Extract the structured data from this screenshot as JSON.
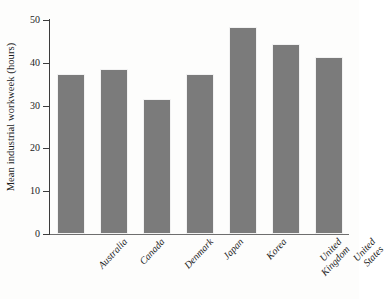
{
  "chart_data": {
    "type": "bar",
    "title": "",
    "subtitle": "",
    "xlabel": "",
    "ylabel": "Mean industrial workweek (hours)",
    "categories": [
      "Australia",
      "Canada",
      "Denmark",
      "Japan",
      "Korea",
      "United Kingdom",
      "United States"
    ],
    "category_lines": [
      [
        "Australia"
      ],
      [
        "Canada"
      ],
      [
        "Denmark"
      ],
      [
        "Japan"
      ],
      [
        "Korea"
      ],
      [
        "United",
        "Kingdom"
      ],
      [
        "United",
        "States"
      ]
    ],
    "values": [
      37,
      38,
      31,
      37,
      48,
      44,
      41
    ],
    "ylim": [
      0,
      50
    ],
    "yticks": [
      0,
      10,
      20,
      30,
      40,
      50
    ],
    "ytick_labels": [
      "0",
      "10",
      "20",
      "30",
      "40",
      "50"
    ],
    "grid": false,
    "legend": false,
    "legend_position": "none",
    "bar_color": "#7b7b7b",
    "axis_color": "#3c3c3c",
    "background_color": "#fdfdfc",
    "bar_label_rotation_deg": -47
  }
}
